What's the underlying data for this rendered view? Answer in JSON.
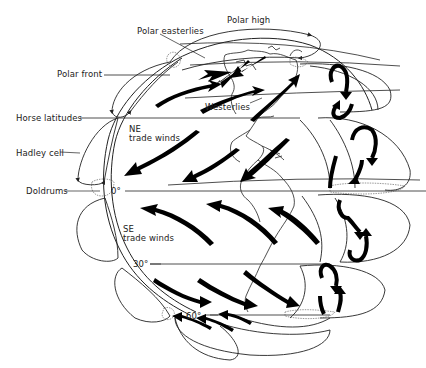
{
  "diagram": {
    "type": "global-atmospheric-circulation",
    "labels": {
      "polar_high": "Polar high",
      "polar_easterlies": "Polar easterlies",
      "polar_front": "Polar front",
      "westerlies": "Westerlies",
      "horse_latitudes": "Horse latitudes",
      "ne_trade_winds_1": "NE",
      "ne_trade_winds_2": "trade winds",
      "hadley_cell": "Hadley cell",
      "doldrums": "Doldrums",
      "equator": "0°",
      "se_trade_winds_1": "SE",
      "se_trade_winds_2": "trade winds",
      "lat_30s": "30°",
      "lat_60s": "60°"
    },
    "colors": {
      "line": "#222222",
      "arrow": "#000000",
      "background": "#ffffff"
    }
  }
}
